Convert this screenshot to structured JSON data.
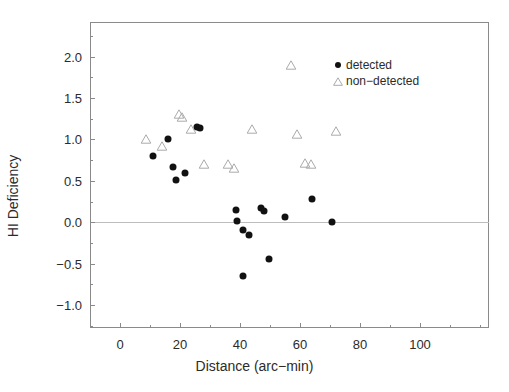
{
  "chart_data": {
    "type": "scatter",
    "title": "",
    "xlabel": "Distance (arc-min)",
    "ylabel": "HI Deficiency",
    "xlim": [
      -10,
      123
    ],
    "ylim": [
      -1.28,
      2.42
    ],
    "xticks": [
      0,
      20,
      40,
      60,
      80,
      100
    ],
    "xtick_labels": [
      "0",
      "20",
      "40",
      "60",
      "80",
      "100"
    ],
    "yticks": [
      -1.0,
      -0.5,
      0.0,
      0.5,
      1.0,
      1.5,
      2.0
    ],
    "ytick_labels": [
      "-1.0",
      "-0.5",
      "0.0",
      "0.5",
      "1.0",
      "1.5",
      "2.0"
    ],
    "grid": false,
    "reference_lines": [
      {
        "axis": "y",
        "value": 0.0
      }
    ],
    "legend_position": "top-right",
    "series": [
      {
        "name": "detected",
        "marker": "filled-circle",
        "color": "#111111",
        "points": [
          [
            11.0,
            0.8
          ],
          [
            16.0,
            1.0
          ],
          [
            17.5,
            0.67
          ],
          [
            18.5,
            0.51
          ],
          [
            21.5,
            0.59
          ],
          [
            25.5,
            1.15
          ],
          [
            26.5,
            1.14
          ],
          [
            38.5,
            0.15
          ],
          [
            39.0,
            0.01
          ],
          [
            41.0,
            -0.09
          ],
          [
            43.0,
            -0.15
          ],
          [
            41.0,
            -0.65
          ],
          [
            47.0,
            0.17
          ],
          [
            48.0,
            0.14
          ],
          [
            49.5,
            -0.44
          ],
          [
            55.0,
            0.06
          ],
          [
            64.0,
            0.28
          ],
          [
            70.5,
            0.0
          ]
        ]
      },
      {
        "name": "non-detected",
        "marker": "open-triangle",
        "color": "#aaaaaa",
        "points": [
          [
            8.5,
            1.01
          ],
          [
            14.0,
            0.92
          ],
          [
            19.5,
            1.31
          ],
          [
            20.5,
            1.27
          ],
          [
            23.5,
            1.13
          ],
          [
            28.0,
            0.7
          ],
          [
            36.0,
            0.7
          ],
          [
            38.0,
            0.66
          ],
          [
            44.0,
            1.13
          ],
          [
            57.0,
            1.9
          ],
          [
            59.0,
            1.07
          ],
          [
            61.5,
            0.72
          ],
          [
            63.5,
            0.7
          ],
          [
            72.0,
            1.1
          ]
        ]
      }
    ],
    "legend_entries": [
      {
        "label": "detected",
        "marker": "filled-circle"
      },
      {
        "label": "non-detected",
        "marker": "open-triangle"
      }
    ]
  }
}
